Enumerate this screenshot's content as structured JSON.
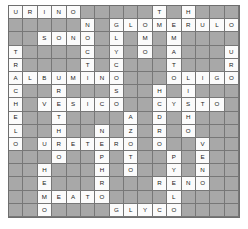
{
  "puzzle": {
    "type": "crossword-answer-grid",
    "rows": 16,
    "columns": 16,
    "colors": {
      "blocked_cell": "#a8a8a8",
      "open_cell": "#fbfbfb",
      "grid_line": "#777777",
      "border": "#6e6e6e",
      "letter": "#1a1a1a",
      "page_background": "#ffffff"
    },
    "legend": {
      "blocked": "#",
      "open_blank": "."
    },
    "grid": [
      "URINO#####T#H###",
      "#####N#GLOMERULO",
      "##SONO#L#M#M####",
      "T####C#Y#O#A###U",
      "R####T#C###T###R",
      "ALBUMINO###OLIGO",
      "C##R###S##H#I###",
      "H#VESICO##CYSTO#",
      "E##T####A#D#H###",
      "L##H##N#Z#R#O###",
      "O#URETERO#O##V##",
      "###O##P#T##P#E##",
      "##H###H#O##Y#N##",
      "##E###R###RENO##",
      "##MEATO####L####",
      "##O####GLYCO####"
    ],
    "across_answers": [
      {
        "row": 1,
        "col": 1,
        "word": "URINO"
      },
      {
        "row": 2,
        "col": 8,
        "word": "GLOMERULO"
      },
      {
        "row": 3,
        "col": 3,
        "word": "SONO"
      },
      {
        "row": 6,
        "col": 1,
        "word": "ALBUMINO"
      },
      {
        "row": 6,
        "col": 12,
        "word": "OLIGO"
      },
      {
        "row": 8,
        "col": 3,
        "word": "VESICO"
      },
      {
        "row": 8,
        "col": 11,
        "word": "CYSTO"
      },
      {
        "row": 11,
        "col": 3,
        "word": "URETERO"
      },
      {
        "row": 14,
        "col": 11,
        "word": "RENO"
      },
      {
        "row": 15,
        "col": 3,
        "word": "MEATO"
      },
      {
        "row": 16,
        "col": 8,
        "word": "GLYCO"
      }
    ],
    "down_answers": [
      {
        "row": 1,
        "col": 1,
        "word": "URINO",
        "note": "across start"
      },
      {
        "row": 4,
        "col": 1,
        "word": "TRACHELO"
      },
      {
        "row": 2,
        "col": 6,
        "word": "NOCTI"
      },
      {
        "row": 3,
        "col": 8,
        "word": "LYCOS"
      },
      {
        "row": 1,
        "col": 10,
        "word": "TMO"
      },
      {
        "row": 1,
        "col": 12,
        "word": "HEMATO"
      },
      {
        "row": 6,
        "col": 13,
        "word": "LITHO"
      },
      {
        "row": 7,
        "col": 4,
        "word": "RETHRO"
      },
      {
        "row": 9,
        "col": 9,
        "word": "AZOTO"
      },
      {
        "row": 7,
        "col": 11,
        "word": "HYDRO"
      },
      {
        "row": 11,
        "col": 14,
        "word": "VEN"
      },
      {
        "row": 12,
        "col": 7,
        "word": "PHR"
      },
      {
        "row": 12,
        "col": 12,
        "word": "PYEL"
      },
      {
        "row": 13,
        "col": 3,
        "word": "HEMO"
      }
    ]
  }
}
